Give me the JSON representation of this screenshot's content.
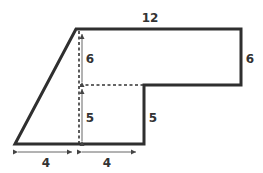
{
  "diagram": {
    "type": "composite-shape",
    "stroke_color": "#2f2f2f",
    "label_color": "#333333",
    "labels": {
      "top_width": "12",
      "right_height": "6",
      "upper_inner_height": "6",
      "lower_inner_height": "5",
      "step_height": "5",
      "bottom_left_width": "4",
      "bottom_right_width": "4"
    }
  }
}
